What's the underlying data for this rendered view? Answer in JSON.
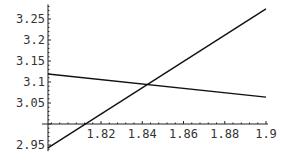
{
  "chart_data": {
    "type": "line",
    "title": "",
    "xlabel": "",
    "ylabel": "",
    "xlim": [
      1.7943,
      1.9
    ],
    "ylim": [
      2.94,
      3.28
    ],
    "axes_origin": {
      "x": 1.7943,
      "y": 3.0
    },
    "grid": false,
    "legend": "none",
    "x_ticks": [
      {
        "value": 1.82,
        "label": "1.82"
      },
      {
        "value": 1.84,
        "label": "1.84"
      },
      {
        "value": 1.86,
        "label": "1.86"
      },
      {
        "value": 1.88,
        "label": "1.88"
      },
      {
        "value": 1.9,
        "label": "1.9"
      }
    ],
    "y_ticks": [
      {
        "value": 2.95,
        "label": "2.95"
      },
      {
        "value": 3.05,
        "label": "3.05"
      },
      {
        "value": 3.1,
        "label": "3.1"
      },
      {
        "value": 3.15,
        "label": "3.15"
      },
      {
        "value": 3.2,
        "label": "3.2"
      },
      {
        "value": 3.25,
        "label": "3.25"
      }
    ],
    "series": [
      {
        "name": "decreasing-line",
        "x": [
          1.7943,
          1.9
        ],
        "y": [
          3.119,
          3.064
        ]
      },
      {
        "name": "increasing-line",
        "x": [
          1.7943,
          1.9
        ],
        "y": [
          2.943,
          3.274
        ]
      }
    ],
    "annotations": []
  }
}
